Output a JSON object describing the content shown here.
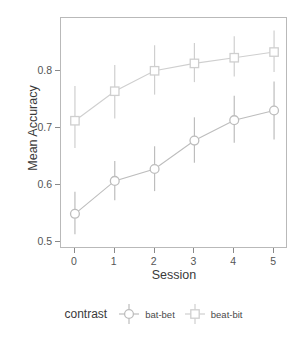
{
  "chart_data": {
    "type": "line",
    "title": "",
    "subtitle": "",
    "xlabel": "Session",
    "ylabel": "Mean Accuracy",
    "x": [
      0,
      1,
      2,
      3,
      4,
      5
    ],
    "xtick_labels": [
      "0",
      "1",
      "2",
      "3",
      "4",
      "5"
    ],
    "ytick_labels": [
      "0.5",
      "0.6",
      "0.7",
      "0.8"
    ],
    "ytick_values": [
      0.5,
      0.6,
      0.7,
      0.8
    ],
    "xlim": [
      -0.35,
      5.35
    ],
    "ylim": [
      0.487,
      0.894
    ],
    "grid": false,
    "legend_position": "bottom",
    "legend_title": "contrast",
    "errorbars": "95% CI",
    "series": [
      {
        "name": "bat-bet",
        "marker": "circle",
        "color": "#bdbdbd",
        "values": [
          0.549,
          0.607,
          0.628,
          0.678,
          0.714,
          0.731
        ],
        "err_low": [
          0.513,
          0.573,
          0.589,
          0.639,
          0.674,
          0.68
        ],
        "err_high": [
          0.588,
          0.642,
          0.668,
          0.719,
          0.757,
          0.782
        ]
      },
      {
        "name": "beat-bit",
        "marker": "square",
        "color": "#cfcfcf",
        "values": [
          0.713,
          0.765,
          0.801,
          0.814,
          0.824,
          0.834
        ],
        "err_low": [
          0.665,
          0.717,
          0.759,
          0.781,
          0.791,
          0.799
        ],
        "err_high": [
          0.774,
          0.811,
          0.846,
          0.85,
          0.862,
          0.872
        ]
      }
    ]
  },
  "legend": {
    "title": "contrast",
    "items": [
      {
        "label": "bat-bet",
        "marker": "circle"
      },
      {
        "label": "beat-bit",
        "marker": "square"
      }
    ]
  },
  "axes": {
    "x_title": "Session",
    "y_title": "Mean Accuracy"
  },
  "colors": {
    "series_a": "#bdbdbd",
    "series_b": "#cfcfcf",
    "panel_border": "#b9b9b9",
    "tick": "#8a8a8a",
    "text": "#4d4d4d",
    "background": "#ffffff"
  }
}
